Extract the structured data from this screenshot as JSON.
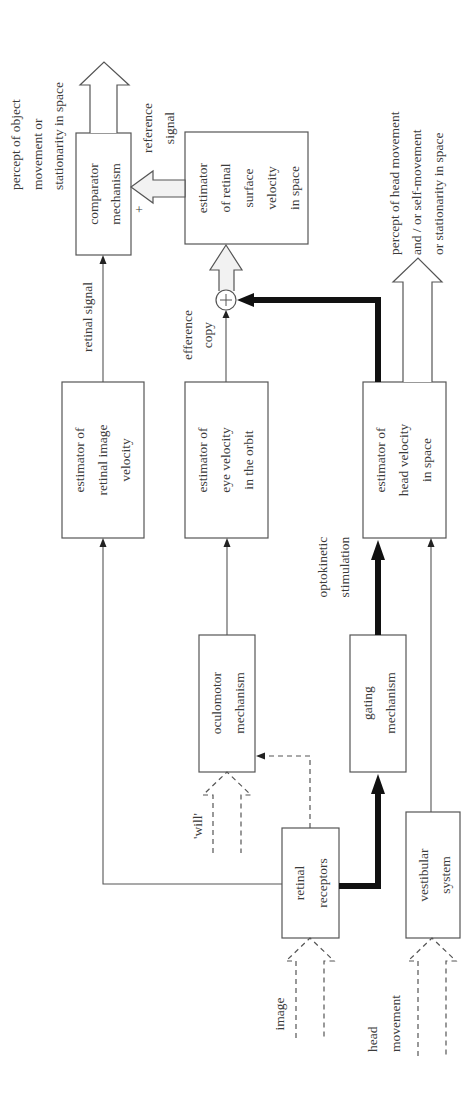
{
  "diagram": {
    "boxes": {
      "comparator": [
        "comparator",
        "mechanism"
      ],
      "retinal_surface": [
        "estimator",
        "of retinal",
        "surface",
        "velocity",
        "in space"
      ],
      "retinal_image": [
        "estimator of",
        "retinal image",
        "velocity"
      ],
      "eye_velocity": [
        "estimator of",
        "eye velocity",
        "in the orbit"
      ],
      "head_velocity": [
        "estimator of",
        "head velocity",
        "in space"
      ],
      "oculomotor": [
        "oculomotor",
        "mechanism"
      ],
      "gating": [
        "gating",
        "mechanism"
      ],
      "retinal_receptors": [
        "retinal",
        "receptors"
      ],
      "vestibular": [
        "vestibular",
        "system"
      ]
    },
    "labels": {
      "percept_object": [
        "percept of object",
        "movement or",
        "stationarity in space"
      ],
      "percept_head": [
        "percept of head movement",
        "and / or self-movement",
        "or stationarity in space"
      ],
      "reference_signal": [
        "reference",
        "signal"
      ],
      "plus_sign": "+",
      "sum_symbol": "+",
      "retinal_signal": "retinal signal",
      "efference_copy": [
        "efference",
        "copy"
      ],
      "optokinetic": [
        "optokinetic",
        "stimulation"
      ],
      "will": "'will'",
      "image": "image",
      "head_movement": [
        "head",
        "movement"
      ]
    }
  }
}
